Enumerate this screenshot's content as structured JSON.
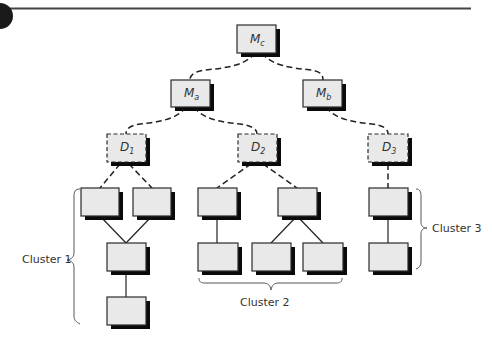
{
  "figure": {
    "colors": {
      "box_fill": "#e9e9e9",
      "box_stroke": "#2a2a2a",
      "shadow": "#0a0a0a",
      "edge": "#222222"
    }
  },
  "nodes": {
    "Mc": {
      "main": "M",
      "sub": "c"
    },
    "Ma": {
      "main": "M",
      "sub": "a"
    },
    "Mb": {
      "main": "M",
      "sub": "b"
    },
    "D1": {
      "main": "D",
      "sub": "1"
    },
    "D2": {
      "main": "D",
      "sub": "2"
    },
    "D3": {
      "main": "D",
      "sub": "3"
    }
  },
  "clusters": {
    "c1": {
      "label": "Cluster 1"
    },
    "c2": {
      "label": "Cluster 2"
    },
    "c3": {
      "label": "Cluster 3"
    }
  }
}
